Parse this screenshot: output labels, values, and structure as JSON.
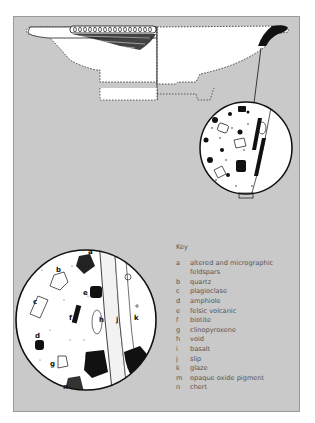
{
  "figure": {
    "colors": {
      "panel_bg": "#c9c9c9",
      "panel_border": "#9a9a9a",
      "ink": "#111111",
      "key_text": "#555555"
    }
  },
  "key": {
    "title": "Key",
    "items": [
      {
        "letter": "a",
        "label": "altered and micrographic feldspars"
      },
      {
        "letter": "b",
        "label": "quartz"
      },
      {
        "letter": "c",
        "label": "plagioclase"
      },
      {
        "letter": "d",
        "label": "amphiole"
      },
      {
        "letter": "e",
        "label": "felsic volcanic"
      },
      {
        "letter": "f",
        "label": "biotite"
      },
      {
        "letter": "g",
        "label": "clinopyroxene"
      },
      {
        "letter": "h",
        "label": "void"
      },
      {
        "letter": "i",
        "label": "basalt"
      },
      {
        "letter": "j",
        "label": "slip"
      },
      {
        "letter": "k",
        "label": "glaze"
      },
      {
        "letter": "m",
        "label": "opaque oxide pigment"
      },
      {
        "letter": "n",
        "label": "chert"
      }
    ]
  },
  "inset_labels": {
    "a": "a",
    "b": "b",
    "c": "c",
    "d": "d",
    "e": "e",
    "f": "f",
    "g": "g",
    "h": "h",
    "i": "i",
    "j": "j",
    "k": "k",
    "m": "m",
    "n": "n"
  }
}
